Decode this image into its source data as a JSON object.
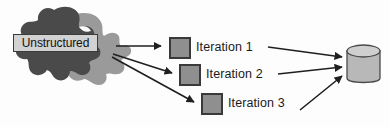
{
  "figure": {
    "type": "process-flow-diagram",
    "background_color": "#fdfdfd"
  },
  "source": {
    "name": "unstructured-data-blob",
    "label": "Unstructured",
    "shape": "amoeba-blob",
    "dark_fill": "#4a4a4a",
    "light_fill": "#9a9a9a",
    "label_box_fill": "#d2d2d2",
    "label_box_border": "#3b3b3b"
  },
  "iterations": [
    {
      "label": "Iteration 1",
      "swatch_fill": "#8f8f8f",
      "swatch_border": "#3a3a3a"
    },
    {
      "label": "Iteration 2",
      "swatch_fill": "#8f8f8f",
      "swatch_border": "#3a3a3a"
    },
    {
      "label": "Iteration 3",
      "swatch_fill": "#8f8f8f",
      "swatch_border": "#3a3a3a"
    }
  ],
  "target": {
    "name": "database-cylinder",
    "label": "",
    "body_fill": "#b8b8b8",
    "top_fill": "#cfcfcf",
    "stroke": "#4b4b4b"
  },
  "connectors": {
    "stroke": "#1f1f1f",
    "outgoing_count": 3,
    "incoming_count": 3
  }
}
